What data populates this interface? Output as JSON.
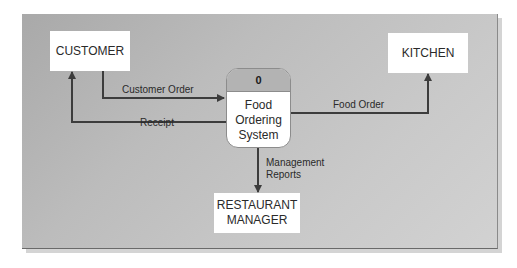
{
  "diagram": {
    "type": "context data flow diagram",
    "process": {
      "number": "0",
      "label_lines": [
        "Food",
        "Ordering",
        "System"
      ]
    },
    "entities": {
      "customer": {
        "label_lines": [
          "CUSTOMER"
        ]
      },
      "kitchen": {
        "label_lines": [
          "KITCHEN"
        ]
      },
      "manager": {
        "label_lines": [
          "RESTAURANT",
          "MANAGER"
        ]
      }
    },
    "flows": {
      "customer_order": {
        "label_lines": [
          "Customer Order"
        ],
        "from": "CUSTOMER",
        "to": "Food Ordering System"
      },
      "receipt": {
        "label_lines": [
          "Receipt"
        ],
        "from": "Food Ordering System",
        "to": "CUSTOMER"
      },
      "food_order": {
        "label_lines": [
          "Food Order"
        ],
        "from": "Food Ordering System",
        "to": "KITCHEN"
      },
      "management_reports": {
        "label_lines": [
          "Management",
          "Reports"
        ],
        "from": "Food Ordering System",
        "to": "RESTAURANT MANAGER"
      }
    },
    "colors": {
      "panel": "#bcbcbc",
      "box": "#ffffff",
      "line": "#3c3c3c",
      "process_header": "#b3b3b3"
    }
  }
}
